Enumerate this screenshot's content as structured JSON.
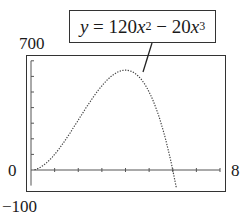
{
  "chart_data": {
    "type": "line",
    "title": "",
    "equation": {
      "lhs": "y",
      "eq": " = ",
      "a": "120",
      "var": "x",
      "exp1": "2",
      "op": " − ",
      "b": "20",
      "exp2": "3"
    },
    "equation_text": "y = 120x^2 − 20x^3",
    "xlim": [
      0,
      8
    ],
    "ylim": [
      -100,
      700
    ],
    "labels": {
      "ymax": "700",
      "ymin": "−100",
      "xmin": "0",
      "xmax": "8"
    },
    "x_ticks": [
      1,
      2,
      3,
      4,
      5,
      6,
      7,
      8
    ],
    "y_ticks": [
      100,
      200,
      300,
      400,
      500,
      600,
      700
    ],
    "grid": false,
    "series": [
      {
        "name": "y = 120x^2 - 20x^3",
        "style": "dotted",
        "x": [
          0,
          0.5,
          1,
          1.5,
          2,
          2.5,
          3,
          3.5,
          4,
          4.5,
          5,
          5.5,
          6,
          6.2
        ],
        "values": [
          0,
          27.5,
          100,
          202.5,
          320,
          437.5,
          540,
          612.5,
          640,
          607.5,
          500,
          302.5,
          0,
          -134.6
        ]
      }
    ],
    "annotations": [
      {
        "text": "y = 120x^2 − 20x^3",
        "points_to_x": 4.8
      }
    ]
  }
}
